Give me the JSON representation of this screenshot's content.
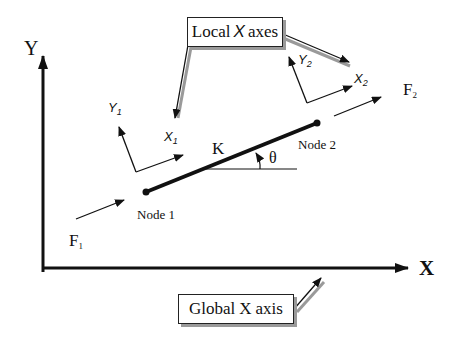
{
  "diagram": {
    "type": "spring element in global and local coordinate systems",
    "global_axes": {
      "y_label": "Y",
      "x_label": "X",
      "callout_prefix": "Global",
      "callout_axis": "X",
      "callout_suffix": "axis"
    },
    "local_axes_callout": {
      "prefix": "Local",
      "axis": "X",
      "suffix": "axes"
    },
    "node1": {
      "label": "Node 1",
      "local_x": "X",
      "local_x_sub": "1",
      "local_y": "Y",
      "local_y_sub": "1",
      "force": "F",
      "force_sub": "1"
    },
    "node2": {
      "label": "Node 2",
      "local_x": "X",
      "local_x_sub": "2",
      "local_y": "Y",
      "local_y_sub": "2",
      "force": "F",
      "force_sub": "2"
    },
    "element": {
      "stiffness_label": "K",
      "angle_label": "θ"
    },
    "colors": {
      "line": "#111111",
      "shadow": "#9a9a9a",
      "background": "#ffffff"
    }
  }
}
